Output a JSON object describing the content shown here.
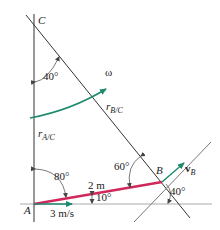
{
  "diagram": {
    "points": {
      "A": "A",
      "B": "B",
      "C": "C"
    },
    "angles": {
      "at_C": "40°",
      "at_A": "80°",
      "at_B_upper": "60°",
      "at_B_lower": "40°",
      "bar_incline": "10°"
    },
    "vectors": {
      "omega": "ω",
      "r_BC_main": "r",
      "r_BC_sub": "B/C",
      "r_AC_main": "r",
      "r_AC_sub": "A/C",
      "vB_main": "v",
      "vB_sub": "B"
    },
    "dimensions": {
      "bar_length": "2 m",
      "speed_A": "3 m/s"
    },
    "colors": {
      "bar": "#d0285a",
      "velocity": "#1e8a6e",
      "line": "#333333",
      "ground": "#aaaaaa"
    }
  }
}
